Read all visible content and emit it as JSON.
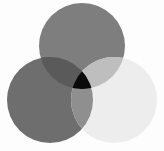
{
  "figure": {
    "caption": "",
    "background_color": "#fdfdfd",
    "width": 164,
    "height": 151
  },
  "chart_data": {
    "type": "venn",
    "subtitle": "",
    "xlabel": "",
    "ylabel": "",
    "grid": false,
    "legend_position": "none",
    "annotations": [],
    "blend_mode": "multiply",
    "set_count": 3,
    "radius": 43,
    "sets": [
      {
        "id": "top",
        "name": "Top circle",
        "label": "",
        "center_x": 82,
        "center_y": 46,
        "radius": 43,
        "color": "#7e7e7e",
        "opacity": 1
      },
      {
        "id": "left",
        "name": "Left circle",
        "label": "",
        "center_x": 50,
        "center_y": 100,
        "radius": 43,
        "color": "#6e6e6e",
        "opacity": 1
      },
      {
        "id": "right",
        "name": "Right circle",
        "label": "",
        "center_x": 114,
        "center_y": 100,
        "radius": 43,
        "color": "#ededed",
        "opacity": 1
      }
    ],
    "regions": [
      {
        "id": "top-only",
        "members": [
          "top"
        ],
        "color": "#7e7e7e",
        "label": ""
      },
      {
        "id": "left-only",
        "members": [
          "left"
        ],
        "color": "#6e6e6e",
        "label": ""
      },
      {
        "id": "right-only",
        "members": [
          "right"
        ],
        "color": "#ededed",
        "label": ""
      },
      {
        "id": "top-left",
        "members": [
          "top",
          "left"
        ],
        "color": "#5a5a5a",
        "label": ""
      },
      {
        "id": "top-right",
        "members": [
          "top",
          "right"
        ],
        "color": "#bebebe",
        "label": ""
      },
      {
        "id": "left-right",
        "members": [
          "left",
          "right"
        ],
        "color": "#8f8f8f",
        "label": ""
      },
      {
        "id": "top-left-right",
        "members": [
          "top",
          "left",
          "right"
        ],
        "color": "#0a0a0a",
        "label": ""
      }
    ]
  }
}
